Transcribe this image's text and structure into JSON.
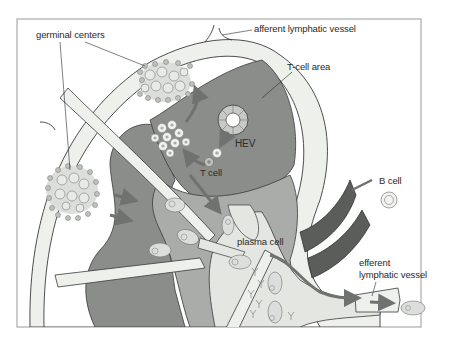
{
  "diagram": {
    "labels": {
      "germinal_centers": "germinal centers",
      "afferent_vessel": "afferent lymphatic vessel",
      "t_cell_area": "T-cell area",
      "hev": "HEV",
      "t_cell": "T cell",
      "b_cell": "B cell",
      "plasma_cell": "plasma cell",
      "efferent_line1": "efferent",
      "efferent_line2": "lymphatic vessel"
    },
    "colors": {
      "capsule_fill": "#eef0ec",
      "dark_tissue": "#8a8d8a",
      "mid_tissue": "#a9aca8",
      "light_medulla": "#e4e6e2",
      "blood_vessel": "#5a5d5a",
      "arrow": "#6f726f",
      "cell_fill": "#d6d8d4",
      "outline": "#3a3a3a",
      "frame": "#9a9a9a"
    }
  }
}
